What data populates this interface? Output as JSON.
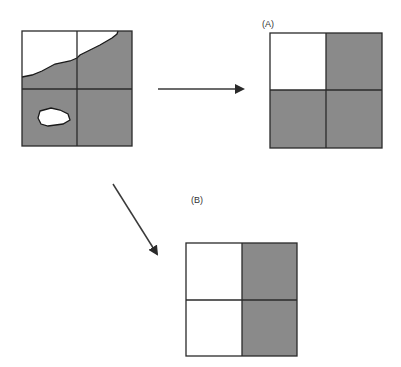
{
  "diagram": {
    "colors": {
      "fill": "#8a8a8a",
      "empty": "#ffffff",
      "line": "#2a2a2a",
      "arrow": "#3a3a3a"
    },
    "source_grid": {
      "description": "2x2 grid over irregular region with a hole",
      "cells": [
        {
          "row": 0,
          "col": 0,
          "state": "partial"
        },
        {
          "row": 0,
          "col": 1,
          "state": "partial"
        },
        {
          "row": 1,
          "col": 0,
          "state": "partial"
        },
        {
          "row": 1,
          "col": 1,
          "state": "filled"
        }
      ]
    },
    "grid_a": {
      "label": "(A)",
      "cells": [
        {
          "row": 0,
          "col": 0,
          "state": "empty"
        },
        {
          "row": 0,
          "col": 1,
          "state": "filled"
        },
        {
          "row": 1,
          "col": 0,
          "state": "filled"
        },
        {
          "row": 1,
          "col": 1,
          "state": "filled"
        }
      ]
    },
    "grid_b": {
      "label": "(B)",
      "cells": [
        {
          "row": 0,
          "col": 0,
          "state": "empty"
        },
        {
          "row": 0,
          "col": 1,
          "state": "filled"
        },
        {
          "row": 1,
          "col": 0,
          "state": "empty"
        },
        {
          "row": 1,
          "col": 1,
          "state": "filled"
        }
      ]
    },
    "arrows": [
      {
        "name": "to-a",
        "direction": "right"
      },
      {
        "name": "to-b",
        "direction": "down-right"
      }
    ]
  }
}
